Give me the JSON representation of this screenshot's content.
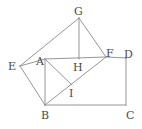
{
  "figure": {
    "width": 142,
    "height": 129,
    "stroke_color": "#8a8a8a",
    "label_color": "#4a4a4a",
    "background": "#ffffff",
    "stroke_width": 0.9
  },
  "points": {
    "A": {
      "label": "A",
      "x": 45,
      "y": 59,
      "label_x": 36,
      "label_y": 56
    },
    "B": {
      "label": "B",
      "x": 45,
      "y": 105,
      "label_x": 41,
      "label_y": 110
    },
    "C": {
      "label": "C",
      "x": 126,
      "y": 105,
      "label_x": 126,
      "label_y": 110
    },
    "D": {
      "label": "D",
      "x": 126,
      "y": 58,
      "label_x": 124,
      "label_y": 49
    },
    "E": {
      "label": "E",
      "x": 20,
      "y": 66,
      "label_x": 8,
      "label_y": 61
    },
    "F": {
      "label": "F",
      "x": 106,
      "y": 57,
      "label_x": 106,
      "label_y": 48
    },
    "G": {
      "label": "G",
      "x": 79,
      "y": 18,
      "label_x": 74,
      "label_y": 6
    },
    "H": {
      "label": "H",
      "x": 79,
      "y": 59,
      "label_x": 73,
      "label_y": 62
    },
    "I": {
      "label": "I",
      "x": 72,
      "y": 85,
      "label_x": 69,
      "label_y": 88
    }
  },
  "segments": [
    {
      "name": "segment-E-A",
      "from": "E",
      "to": "A"
    },
    {
      "name": "segment-E-B",
      "from": "E",
      "to": "B"
    },
    {
      "name": "segment-E-G",
      "from": "E",
      "to": "G"
    },
    {
      "name": "segment-G-F",
      "from": "G",
      "to": "F"
    },
    {
      "name": "segment-G-H",
      "from": "G",
      "to": "H"
    },
    {
      "name": "segment-A-F",
      "from": "A",
      "to": "F"
    },
    {
      "name": "segment-F-D",
      "from": "F",
      "to": "D"
    },
    {
      "name": "segment-D-C",
      "from": "D",
      "to": "C"
    },
    {
      "name": "segment-C-B",
      "from": "C",
      "to": "B"
    },
    {
      "name": "segment-B-A",
      "from": "B",
      "to": "A"
    },
    {
      "name": "segment-B-F",
      "from": "B",
      "to": "F"
    },
    {
      "name": "segment-A-I",
      "from": "A",
      "to": "I"
    }
  ]
}
